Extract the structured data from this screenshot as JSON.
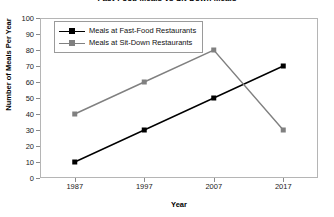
{
  "chart_data": {
    "type": "line",
    "title": "Fast-Food Meals vs Sit-Down Meals",
    "xlabel": "Year",
    "ylabel": "Number of Meals Per Year",
    "categories": [
      "1987",
      "1997",
      "2007",
      "2017"
    ],
    "ylim": [
      0,
      100
    ],
    "ytick_step": 10,
    "yticks": [
      "100",
      "90",
      "80",
      "70",
      "60",
      "50",
      "40",
      "30",
      "20",
      "10",
      "0"
    ],
    "grid": false,
    "legend_position": "top-left-inside",
    "series": [
      {
        "name": "Meals at Fast-Food Restaurants",
        "values": [
          10,
          30,
          50,
          70
        ],
        "color": "#000000",
        "marker": "square"
      },
      {
        "name": "Meals at Sit-Down Restaurants",
        "values": [
          40,
          60,
          80,
          30
        ],
        "color": "#808080",
        "marker": "square"
      }
    ]
  }
}
